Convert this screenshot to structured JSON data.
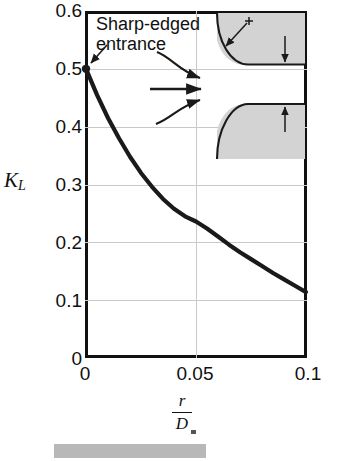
{
  "chart_data": {
    "type": "line",
    "title": "",
    "xlabel": "r/D",
    "ylabel": "K_L",
    "xlim": [
      0,
      0.1
    ],
    "ylim": [
      0,
      0.6
    ],
    "grid": true,
    "legend": "none",
    "x_ticks": [
      "0",
      "0.05",
      "0.1"
    ],
    "x_tick_values": [
      0,
      0.05,
      0.1
    ],
    "y_ticks": [
      "0",
      "0.1",
      "0.2",
      "0.3",
      "0.4",
      "0.5",
      "0.6"
    ],
    "y_tick_values": [
      0,
      0.1,
      0.2,
      0.3,
      0.4,
      0.5,
      0.6
    ],
    "x_gridlines": [
      0.05
    ],
    "y_gridlines": [
      0.1,
      0.2,
      0.3,
      0.4,
      0.5
    ],
    "series": [
      {
        "name": "Loss coefficient",
        "x": [
          0,
          0.005,
          0.01,
          0.015,
          0.02,
          0.025,
          0.03,
          0.035,
          0.04,
          0.045,
          0.05,
          0.055,
          0.06,
          0.065,
          0.07,
          0.075,
          0.08,
          0.085,
          0.09,
          0.095,
          0.1
        ],
        "values": [
          0.5,
          0.455,
          0.415,
          0.38,
          0.348,
          0.32,
          0.296,
          0.275,
          0.258,
          0.245,
          0.236,
          0.224,
          0.21,
          0.196,
          0.183,
          0.171,
          0.159,
          0.147,
          0.136,
          0.125,
          0.114
        ]
      }
    ],
    "markers": [
      {
        "x": 0,
        "y": 0.5,
        "label": "Sharp-edged entrance"
      }
    ],
    "annotations": [
      {
        "text": "Sharp-edged",
        "target": "point at r/D = 0, K_L = 0.5"
      },
      {
        "text": "entrance",
        "target": "point at r/D = 0, K_L = 0.5"
      }
    ]
  },
  "axes": {
    "y_label_main": "K",
    "y_label_sub": "L",
    "x_label_numerator": "r",
    "x_label_denominator": "D"
  },
  "annotation": {
    "line1": "Sharp-edged",
    "line2": "entrance"
  },
  "inset": {
    "name": "rounded-pipe-entrance-diagram",
    "radius_label": "r",
    "diameter_label": "D",
    "wall_fill": "#d3d3d3",
    "wall_stroke": "#1a1a1a",
    "flow_arrow_count": 3
  },
  "colors": {
    "curve": "#1a1a1a",
    "frame": "#111111",
    "gridline": "#c9c9c9",
    "wall_gray": "#d3d3d3",
    "text": "#111111",
    "caption_bar": "#b8b8b8"
  }
}
